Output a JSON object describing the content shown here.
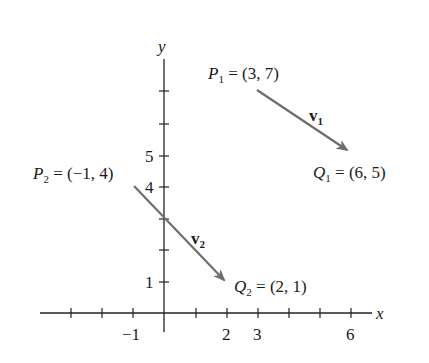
{
  "diagram": {
    "axes": {
      "x_label": "x",
      "y_label": "y",
      "x_tick_labels": [
        {
          "value": -1,
          "label": "−1"
        },
        {
          "value": 2,
          "label": "2"
        },
        {
          "value": 3,
          "label": "3"
        },
        {
          "value": 6,
          "label": "6"
        }
      ],
      "y_tick_labels": [
        {
          "value": 1,
          "label": "1"
        },
        {
          "value": 4,
          "label": "4"
        },
        {
          "value": 5,
          "label": "5"
        }
      ],
      "x_ticks": [
        -3,
        -2,
        -1,
        1,
        2,
        3,
        4,
        5,
        6
      ],
      "y_ticks": [
        1,
        2,
        3,
        4,
        5,
        6,
        7
      ]
    },
    "vectors": [
      {
        "name": "v",
        "subscript": "1",
        "start": {
          "name": "P",
          "subscript": "1",
          "coords": "(3, 7)",
          "x": 3,
          "y": 7
        },
        "end": {
          "name": "Q",
          "subscript": "1",
          "coords": "(6, 5)",
          "x": 6,
          "y": 5
        }
      },
      {
        "name": "v",
        "subscript": "2",
        "start": {
          "name": "P",
          "subscript": "2",
          "coords": "(−1, 4)",
          "x": -1,
          "y": 4
        },
        "end": {
          "name": "Q",
          "subscript": "2",
          "coords": "(2, 1)",
          "x": 2,
          "y": 1
        }
      }
    ],
    "colors": {
      "axis": "#222222",
      "vector": "#6e6e6e",
      "text": "#1a1a1a"
    },
    "labels": {
      "eq": " = "
    }
  }
}
